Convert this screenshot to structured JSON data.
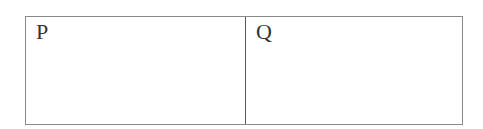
{
  "diagram": {
    "cells": [
      {
        "label": "P"
      },
      {
        "label": "Q"
      }
    ],
    "colors": {
      "border": "#8a8a8a",
      "divider": "#555555",
      "text": "#333333",
      "background": "#ffffff"
    }
  }
}
